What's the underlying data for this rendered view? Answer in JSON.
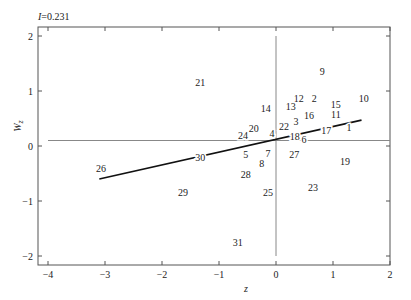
{
  "chart_data": {
    "type": "scatter",
    "title": "I=0.231",
    "xlabel": "z",
    "ylabel": "Wz",
    "xlim": [
      -4.15,
      2.0
    ],
    "ylim": [
      -2.15,
      2.15
    ],
    "xticks": [
      -4,
      -3,
      -2,
      -1,
      0,
      1,
      2
    ],
    "yticks": [
      -2,
      -1,
      0,
      1,
      2
    ],
    "grid": false,
    "reference_lines": {
      "horizontal_y": 0.1,
      "vertical_x": 0
    },
    "regression_line": {
      "x": [
        -3.1,
        1.5
      ],
      "y": [
        -0.6,
        0.47
      ]
    },
    "points": [
      {
        "label": "1",
        "x": 1.28,
        "y": 0.33
      },
      {
        "label": "2",
        "x": 0.67,
        "y": 0.87
      },
      {
        "label": "3",
        "x": 0.35,
        "y": 0.45
      },
      {
        "label": "4",
        "x": -0.07,
        "y": 0.22
      },
      {
        "label": "5",
        "x": -0.53,
        "y": -0.15
      },
      {
        "label": "6",
        "x": 0.49,
        "y": 0.11
      },
      {
        "label": "7",
        "x": -0.14,
        "y": -0.13
      },
      {
        "label": "8",
        "x": -0.25,
        "y": -0.31
      },
      {
        "label": "9",
        "x": 0.81,
        "y": 1.35
      },
      {
        "label": "10",
        "x": 1.54,
        "y": 0.87
      },
      {
        "label": "11",
        "x": 1.05,
        "y": 0.58
      },
      {
        "label": "12",
        "x": 0.4,
        "y": 0.87
      },
      {
        "label": "13",
        "x": 0.26,
        "y": 0.71
      },
      {
        "label": "14",
        "x": -0.18,
        "y": 0.69
      },
      {
        "label": "15",
        "x": 1.05,
        "y": 0.76
      },
      {
        "label": "16",
        "x": 0.58,
        "y": 0.55
      },
      {
        "label": "17",
        "x": 0.88,
        "y": 0.29
      },
      {
        "label": "18",
        "x": 0.33,
        "y": 0.18
      },
      {
        "label": "19",
        "x": 1.21,
        "y": -0.29
      },
      {
        "label": "20",
        "x": -0.39,
        "y": 0.31
      },
      {
        "label": "21",
        "x": -1.33,
        "y": 1.16
      },
      {
        "label": "22",
        "x": 0.14,
        "y": 0.35
      },
      {
        "label": "23",
        "x": 0.65,
        "y": -0.76
      },
      {
        "label": "24",
        "x": -0.58,
        "y": 0.2
      },
      {
        "label": "25",
        "x": -0.14,
        "y": -0.84
      },
      {
        "label": "26",
        "x": -3.07,
        "y": -0.4
      },
      {
        "label": "27",
        "x": 0.32,
        "y": -0.15
      },
      {
        "label": "28",
        "x": -0.53,
        "y": -0.51
      },
      {
        "label": "29",
        "x": -1.63,
        "y": -0.85
      },
      {
        "label": "30",
        "x": -1.33,
        "y": -0.2
      },
      {
        "label": "31",
        "x": -0.67,
        "y": -1.75
      }
    ]
  }
}
